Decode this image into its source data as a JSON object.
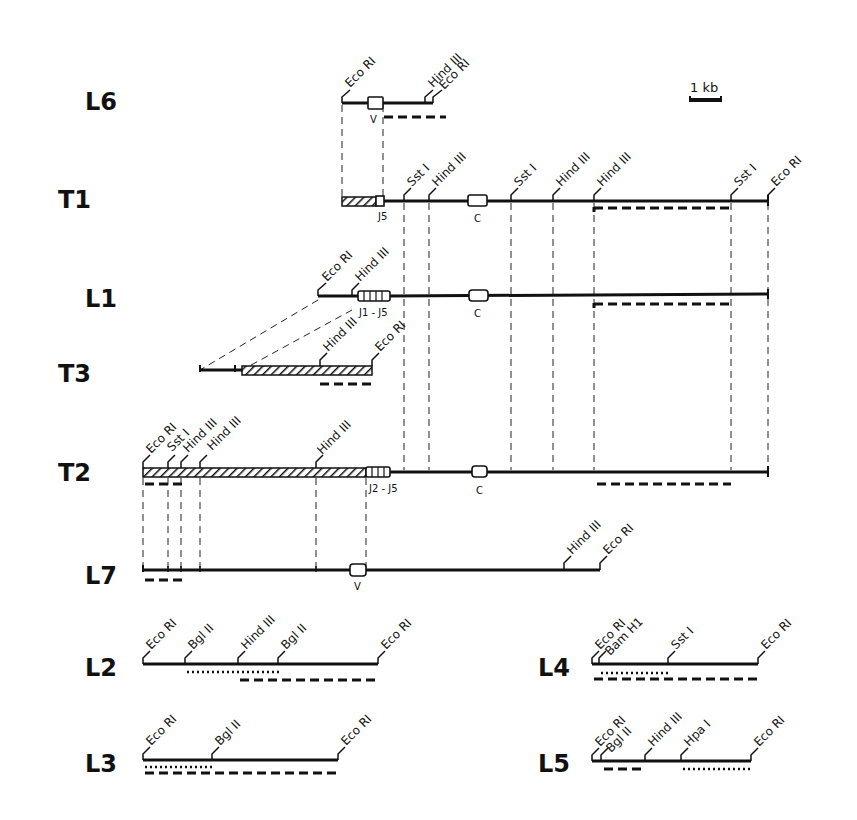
{
  "scale_bar": {
    "label": "1 kb"
  },
  "rows": {
    "L6": {
      "label": "L6",
      "sites": [
        "Eco RI",
        "Hind III",
        "Eco RI"
      ],
      "segment": "V"
    },
    "T1": {
      "label": "T1",
      "sites": [
        "Sst I",
        "Hind III",
        "Sst I",
        "Hind III",
        "Hind III",
        "Sst I",
        "Eco RI"
      ],
      "segments": [
        "J5",
        "C"
      ]
    },
    "L1": {
      "label": "L1",
      "sites": [
        "Eco RI",
        "Hind III"
      ],
      "segments": [
        "J1 - J5",
        "C"
      ]
    },
    "T3": {
      "label": "T3",
      "sites": [
        "Hind III",
        "Eco RI"
      ]
    },
    "T2": {
      "label": "T2",
      "sites": [
        "Eco RI",
        "Sst I",
        "Hind III",
        "Hind III",
        "Hind III"
      ],
      "segments": [
        "J2 - J5",
        "C"
      ]
    },
    "L7": {
      "label": "L7",
      "sites": [
        "Hind III",
        "Eco RI"
      ],
      "segment": "V"
    },
    "L2": {
      "label": "L2",
      "sites": [
        "Eco RI",
        "Bgl II",
        "Hind III",
        "Bgl II",
        "Eco RI"
      ]
    },
    "L3": {
      "label": "L3",
      "sites": [
        "Eco RI",
        "Bgl II",
        "Eco RI"
      ]
    },
    "L4": {
      "label": "L4",
      "sites": [
        "Eco RI",
        "Bam H1",
        "Sst I",
        "Eco RI"
      ]
    },
    "L5": {
      "label": "L5",
      "sites": [
        "Eco RI",
        "Bgl II",
        "Hind III",
        "Hpa I",
        "Eco RI"
      ]
    }
  },
  "legend": {
    "hatched": "rearranged / non-germline flanking DNA",
    "dashed_bar": "probe fragment",
    "dotted_bar": "probe fragment (alternate)"
  }
}
